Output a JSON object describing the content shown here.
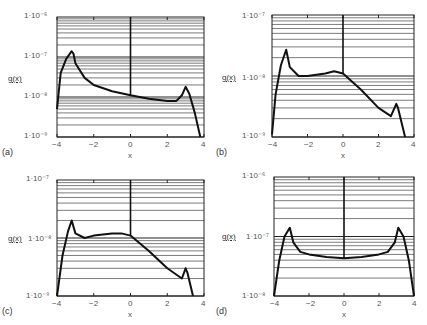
{
  "chart_data": [
    {
      "type": "line",
      "panel": "(a)",
      "title": "",
      "xlabel": "x",
      "ylabel": "g(x)",
      "yscale": "log",
      "xlim": [
        -4,
        4
      ],
      "ylim": [
        1e-09,
        1e-06
      ],
      "xticks": [
        "-4",
        "-2",
        "0",
        "2",
        "4"
      ],
      "yticks": [
        "1·10⁻⁹",
        "1·10⁻⁸",
        "1·10⁻⁷",
        "1·10⁻⁶"
      ],
      "grid": "horizontal log minor",
      "series": [
        {
          "name": "g(x)",
          "x": [
            -4,
            -3.8,
            -3.5,
            -3.2,
            -3.1,
            -3.0,
            -2.5,
            -2,
            -1,
            0,
            1,
            2,
            2.5,
            2.8,
            3.0,
            3.2,
            3.5,
            3.8
          ],
          "y": [
            5e-09,
            4e-08,
            9e-08,
            1.4e-07,
            1.2e-07,
            7e-08,
            3e-08,
            2e-08,
            1.4e-08,
            1.1e-08,
            9e-09,
            8e-09,
            8e-09,
            1.1e-08,
            1.8e-08,
            1.2e-08,
            4e-09,
            1e-09
          ]
        }
      ]
    },
    {
      "type": "line",
      "panel": "(b)",
      "xlabel": "x",
      "ylabel": "g(x)",
      "yscale": "log",
      "xlim": [
        -4,
        4
      ],
      "ylim": [
        1e-09,
        1e-07
      ],
      "xticks": [
        "-4",
        "-2",
        "0",
        "2",
        "4"
      ],
      "yticks": [
        "1·10⁻⁹",
        "1·10⁻⁸",
        "1·10⁻⁷"
      ],
      "grid": "horizontal log minor",
      "series": [
        {
          "name": "g(x)",
          "x": [
            -4,
            -3.8,
            -3.5,
            -3.2,
            -3.0,
            -2.5,
            -2,
            -1,
            -0.5,
            0,
            1,
            2,
            2.7,
            3.0,
            3.1,
            3.5
          ],
          "y": [
            1.1e-09,
            5e-09,
            1.5e-08,
            2.7e-08,
            1.4e-08,
            1e-08,
            1e-08,
            1.1e-08,
            1.2e-08,
            1.1e-08,
            6e-09,
            3e-09,
            2.2e-09,
            3.5e-09,
            3e-09,
            1e-09
          ]
        }
      ]
    },
    {
      "type": "line",
      "panel": "(c)",
      "xlabel": "x",
      "ylabel": "g(x)",
      "yscale": "log",
      "xlim": [
        -4,
        4
      ],
      "ylim": [
        1e-09,
        1e-07
      ],
      "xticks": [
        "-4",
        "-2",
        "0",
        "2",
        "4"
      ],
      "yticks": [
        "1·10⁻⁹",
        "1·10⁻⁸",
        "1·10⁻⁷"
      ],
      "grid": "horizontal log minor",
      "series": [
        {
          "name": "g(x)",
          "x": [
            -4,
            -3.7,
            -3.4,
            -3.2,
            -3.0,
            -2.5,
            -2,
            -1,
            -0.5,
            0,
            1,
            2,
            2.8,
            3.0,
            3.1,
            3.4
          ],
          "y": [
            1e-09,
            5e-09,
            1.3e-08,
            2e-08,
            1.2e-08,
            1e-08,
            1.1e-08,
            1.2e-08,
            1.2e-08,
            1.1e-08,
            6e-09,
            3e-09,
            2e-09,
            3e-09,
            2.5e-09,
            1e-09
          ]
        }
      ]
    },
    {
      "type": "line",
      "panel": "(d)",
      "xlabel": "x",
      "ylabel": "g(x)",
      "yscale": "log",
      "xlim": [
        -4,
        4
      ],
      "ylim": [
        1e-08,
        1e-06
      ],
      "xticks": [
        "-4",
        "-2",
        "0",
        "2",
        "4"
      ],
      "yticks": [
        "1·10⁻⁸",
        "1·10⁻⁷",
        "1·10⁻⁶"
      ],
      "grid": "horizontal log minor",
      "series": [
        {
          "name": "g(x)",
          "x": [
            -4,
            -3.7,
            -3.4,
            -3.1,
            -2.9,
            -2.5,
            -2,
            -1,
            0,
            1,
            2,
            2.5,
            2.9,
            3.1,
            3.4,
            3.7,
            4
          ],
          "y": [
            1e-08,
            4e-08,
            1e-07,
            1.4e-07,
            8e-08,
            5.5e-08,
            5e-08,
            4.5e-08,
            4.3e-08,
            4.5e-08,
            5e-08,
            5.5e-08,
            8e-08,
            1.4e-07,
            1e-07,
            4e-08,
            1e-08
          ]
        }
      ]
    }
  ],
  "panels": [
    {
      "id": "(a)",
      "ylabel": "g(x)",
      "xlabel": "x",
      "yticks": [
        "1·10⁻⁶",
        "1·10⁻⁷",
        "1·10⁻⁸",
        "1·10⁻⁹"
      ],
      "xticks": [
        "−4",
        "−2",
        "0",
        "2",
        "4"
      ]
    },
    {
      "id": "(b)",
      "ylabel": "g(x)",
      "xlabel": "x",
      "yticks": [
        "1·10⁻⁷",
        "1·10⁻⁸",
        "1·10⁻⁹"
      ],
      "xticks": [
        "−4",
        "−2",
        "0",
        "2",
        "4"
      ]
    },
    {
      "id": "(c)",
      "ylabel": "g(x)",
      "xlabel": "x",
      "yticks": [
        "1·10⁻⁷",
        "1·10⁻⁸",
        "1·10⁻⁹"
      ],
      "xticks": [
        "−4",
        "−2",
        "0",
        "2",
        "4"
      ]
    },
    {
      "id": "(d)",
      "ylabel": "g(x)",
      "xlabel": "x",
      "yticks": [
        "1·10⁻⁶",
        "1·10⁻⁷",
        "1·10⁻⁸"
      ],
      "xticks": [
        "−4",
        "−2",
        "0",
        "2",
        "4"
      ]
    }
  ]
}
